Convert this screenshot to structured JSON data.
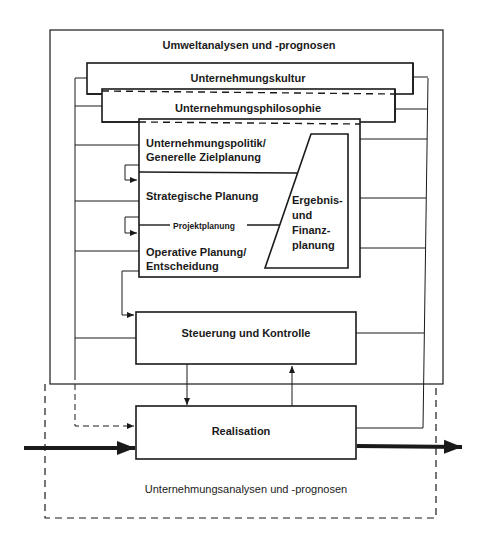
{
  "diagram": {
    "outer_top_label": "Umweltanalysen und -prognosen",
    "culture": "Unternehmungskultur",
    "philosophy": "Unternehmungsphilosophie",
    "policy_line1": "Unternehmungspolitik/",
    "policy_line2": "Generelle Zielplanung",
    "strategic": "Strategische Planung",
    "project": "Projektplanung",
    "operative_line1": "Operative Planung/",
    "operative_line2": "Entscheidung",
    "finance_line1": "Ergebnis-",
    "finance_line2": "und",
    "finance_line3": "Finanz-",
    "finance_line4": "planung",
    "control": "Steuerung und Kontrolle",
    "realization": "Realisation",
    "outer_bottom_label": "Unternehmungsanalysen und -prognosen"
  },
  "colors": {
    "line": "#1a1a1a",
    "background": "#ffffff"
  }
}
